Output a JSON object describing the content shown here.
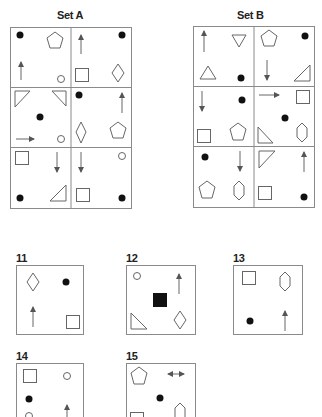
{
  "sets": [
    {
      "id": "A",
      "title": "Set A"
    },
    {
      "id": "B",
      "title": "Set B"
    }
  ],
  "answers": [
    {
      "label": "11"
    },
    {
      "label": "12"
    },
    {
      "label": "13"
    },
    {
      "label": "14"
    },
    {
      "label": "15"
    }
  ],
  "colors": {
    "stroke": "#666666",
    "fill_dark": "#111111",
    "frame": "#8a8a8a"
  }
}
